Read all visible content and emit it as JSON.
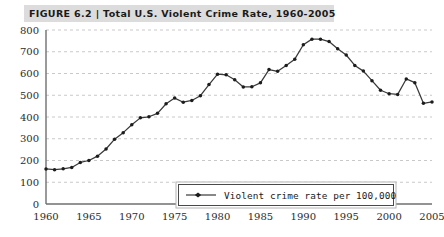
{
  "figure": {
    "label": "FIGURE 6.2",
    "separator": "|",
    "title": "Total U.S. Violent Crime Rate, 1960-2005",
    "title_full": "FIGURE 6.2 | Total U.S. Violent Crime Rate, 1960-2005",
    "band_color": "#dcdcdc"
  },
  "colors": {
    "line": "#3a3a3a",
    "marker": "#1c1c1c",
    "grid": "#c9c9c9",
    "axis": "#6f6f6f",
    "text": "#2b2b2b",
    "background": "#ffffff"
  },
  "chart_data": {
    "type": "line",
    "title": "Total U.S. Violent Crime Rate, 1960-2005",
    "xlabel": "",
    "ylabel": "",
    "xlim": [
      1960,
      2005
    ],
    "ylim": [
      0,
      800
    ],
    "ytick_step": 100,
    "xtick_step": 5,
    "grid": true,
    "grid_axis": "y",
    "grid_style": "dashed",
    "legend_position": "inside-lower-center",
    "legend": [
      "Violent crime rate per 100,000"
    ],
    "markers": true,
    "ytick_labels": [
      "0",
      "100",
      "200",
      "300",
      "400",
      "500",
      "600",
      "700",
      "800"
    ],
    "xtick_labels": [
      "1960",
      "1965",
      "1970",
      "1975",
      "1980",
      "1985",
      "1990",
      "1995",
      "2000",
      "2005"
    ],
    "series": [
      {
        "name": "Violent crime rate per 100,000",
        "x": [
          1960,
          1961,
          1962,
          1963,
          1964,
          1965,
          1966,
          1967,
          1968,
          1969,
          1970,
          1971,
          1972,
          1973,
          1974,
          1975,
          1976,
          1977,
          1978,
          1979,
          1980,
          1981,
          1982,
          1983,
          1984,
          1985,
          1986,
          1987,
          1988,
          1989,
          1990,
          1991,
          1992,
          1993,
          1994,
          1995,
          1996,
          1997,
          1998,
          1999,
          2000,
          2001,
          2002,
          2003,
          2004,
          2005
        ],
        "values": [
          161,
          158,
          162,
          168,
          191,
          200,
          220,
          253,
          298,
          328,
          364,
          396,
          401,
          417,
          461,
          487,
          468,
          476,
          498,
          549,
          597,
          594,
          571,
          538,
          539,
          557,
          618,
          610,
          637,
          666,
          732,
          758,
          758,
          747,
          714,
          685,
          637,
          611,
          567,
          523,
          507,
          504,
          575,
          558,
          463,
          469
        ]
      }
    ]
  }
}
